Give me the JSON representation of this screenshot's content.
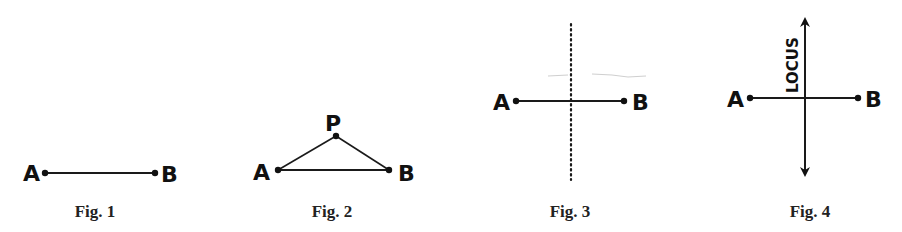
{
  "figures": [
    {
      "id": "fig1",
      "caption": "Fig. 1",
      "labels": {
        "a": "A",
        "b": "B"
      },
      "points": {
        "a": [
          45,
          173
        ],
        "b": [
          155,
          173
        ]
      }
    },
    {
      "id": "fig2",
      "caption": "Fig. 2",
      "labels": {
        "a": "A",
        "b": "B",
        "p": "P"
      },
      "points": {
        "a": [
          278,
          170
        ],
        "b": [
          389,
          170
        ],
        "p": [
          336,
          136
        ]
      }
    },
    {
      "id": "fig3",
      "caption": "Fig. 3",
      "labels": {
        "a": "A",
        "b": "B"
      },
      "points": {
        "a": [
          516,
          101
        ],
        "b": [
          624,
          101
        ]
      },
      "perpendicular_bisector": {
        "x": 571,
        "y1": 24,
        "y2": 180,
        "style": "dotted"
      }
    },
    {
      "id": "fig4",
      "caption": "Fig. 4",
      "labels": {
        "a": "A",
        "b": "B",
        "locus": "LOCUS"
      },
      "points": {
        "a": [
          750,
          98
        ],
        "b": [
          858,
          98
        ]
      },
      "perpendicular_bisector": {
        "x": 805,
        "y1": 12,
        "y2": 182,
        "style": "arrows"
      }
    }
  ],
  "colors": {
    "ink": "#111111",
    "background": "#ffffff"
  }
}
